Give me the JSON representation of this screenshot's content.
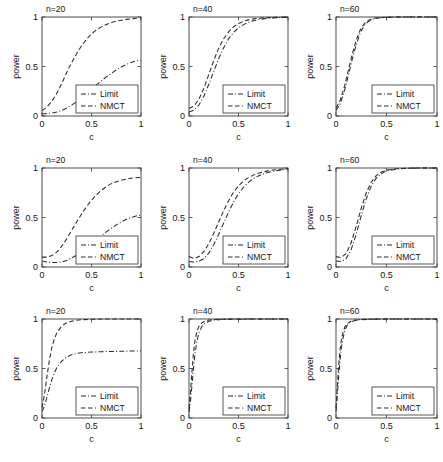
{
  "figure": {
    "layout": "3x3 grid of power curve panels",
    "background_color": "#ffffff",
    "line_color": "#2b2b2b",
    "axis_color": "#3a3a3a"
  },
  "axis": {
    "xlabel": "c",
    "ylabel": "power",
    "xticks": [
      "0",
      "0.5",
      "1"
    ],
    "yticks": [
      "0",
      "0.5",
      "1"
    ],
    "xlim": [
      0,
      1
    ],
    "ylim": [
      0,
      1
    ]
  },
  "legend": {
    "position": "lower-right",
    "entries": [
      {
        "label": "Limit",
        "style": "dash-dot"
      },
      {
        "label": "NMCT",
        "style": "dashed"
      }
    ]
  },
  "chart_data": [
    {
      "type": "line",
      "panel_id": "r1c1",
      "title": "n=20",
      "xlabel": "c",
      "ylabel": "power",
      "xlim": [
        0,
        1
      ],
      "ylim": [
        0,
        1
      ],
      "xticks": [
        0,
        0.5,
        1
      ],
      "yticks": [
        0,
        0.5,
        1
      ],
      "grid": false,
      "legend": [
        "Limit",
        "NMCT"
      ],
      "x": [
        0,
        0.05,
        0.1,
        0.15,
        0.2,
        0.25,
        0.3,
        0.35,
        0.4,
        0.45,
        0.5,
        0.55,
        0.6,
        0.65,
        0.7,
        0.75,
        0.8,
        0.85,
        0.9,
        0.95,
        1.0
      ],
      "series": [
        {
          "name": "Limit",
          "style": "dash-dot",
          "values": [
            0.02,
            0.025,
            0.03,
            0.04,
            0.055,
            0.08,
            0.11,
            0.145,
            0.185,
            0.225,
            0.27,
            0.315,
            0.355,
            0.395,
            0.43,
            0.465,
            0.495,
            0.52,
            0.54,
            0.555,
            0.565
          ]
        },
        {
          "name": "NMCT",
          "style": "dashed",
          "values": [
            0.055,
            0.09,
            0.15,
            0.23,
            0.33,
            0.44,
            0.54,
            0.63,
            0.71,
            0.775,
            0.83,
            0.87,
            0.9,
            0.925,
            0.945,
            0.958,
            0.968,
            0.976,
            0.982,
            0.987,
            0.99
          ]
        }
      ]
    },
    {
      "type": "line",
      "panel_id": "r1c2",
      "title": "n=40",
      "xlabel": "c",
      "ylabel": "power",
      "xlim": [
        0,
        1
      ],
      "ylim": [
        0,
        1
      ],
      "xticks": [
        0,
        0.5,
        1
      ],
      "yticks": [
        0,
        0.5,
        1
      ],
      "grid": false,
      "legend": [
        "Limit",
        "NMCT"
      ],
      "x": [
        0,
        0.05,
        0.1,
        0.15,
        0.2,
        0.25,
        0.3,
        0.35,
        0.4,
        0.45,
        0.5,
        0.55,
        0.6,
        0.65,
        0.7,
        0.75,
        0.8,
        0.85,
        0.9,
        0.95,
        1.0
      ],
      "series": [
        {
          "name": "Limit",
          "style": "dash-dot",
          "values": [
            0.04,
            0.06,
            0.11,
            0.2,
            0.32,
            0.45,
            0.58,
            0.69,
            0.78,
            0.845,
            0.89,
            0.923,
            0.945,
            0.961,
            0.973,
            0.981,
            0.987,
            0.991,
            0.994,
            0.996,
            0.998
          ]
        },
        {
          "name": "NMCT",
          "style": "dashed",
          "values": [
            0.075,
            0.1,
            0.17,
            0.28,
            0.42,
            0.56,
            0.685,
            0.78,
            0.85,
            0.9,
            0.935,
            0.957,
            0.971,
            0.981,
            0.987,
            0.991,
            0.994,
            0.996,
            0.997,
            0.999,
            1.0
          ]
        }
      ]
    },
    {
      "type": "line",
      "panel_id": "r1c3",
      "title": "n=60",
      "xlabel": "c",
      "ylabel": "power",
      "xlim": [
        0,
        1
      ],
      "ylim": [
        0,
        1
      ],
      "xticks": [
        0,
        0.5,
        1
      ],
      "yticks": [
        0,
        0.5,
        1
      ],
      "grid": false,
      "legend": [
        "Limit",
        "NMCT"
      ],
      "x": [
        0,
        0.04,
        0.08,
        0.12,
        0.16,
        0.2,
        0.24,
        0.28,
        0.32,
        0.36,
        0.4,
        0.5,
        0.6,
        0.7,
        0.8,
        0.9,
        1.0
      ],
      "series": [
        {
          "name": "Limit",
          "style": "dash-dot",
          "values": [
            0.055,
            0.12,
            0.24,
            0.4,
            0.57,
            0.72,
            0.84,
            0.915,
            0.955,
            0.977,
            0.988,
            0.997,
            0.999,
            1.0,
            1.0,
            1.0,
            1.0
          ]
        },
        {
          "name": "NMCT",
          "style": "dashed",
          "values": [
            0.08,
            0.155,
            0.285,
            0.45,
            0.62,
            0.765,
            0.87,
            0.932,
            0.966,
            0.983,
            0.992,
            0.998,
            1.0,
            1.0,
            1.0,
            1.0,
            1.0
          ]
        }
      ]
    },
    {
      "type": "line",
      "panel_id": "r2c1",
      "title": "n=20",
      "xlabel": "c",
      "ylabel": "power",
      "xlim": [
        0,
        1
      ],
      "ylim": [
        0,
        1
      ],
      "xticks": [
        0,
        0.5,
        1
      ],
      "yticks": [
        0,
        0.5,
        1
      ],
      "grid": false,
      "legend": [
        "Limit",
        "NMCT"
      ],
      "x": [
        0,
        0.05,
        0.1,
        0.15,
        0.2,
        0.25,
        0.3,
        0.35,
        0.4,
        0.45,
        0.5,
        0.55,
        0.6,
        0.65,
        0.7,
        0.75,
        0.8,
        0.85,
        0.9,
        0.95,
        1.0
      ],
      "series": [
        {
          "name": "Limit",
          "style": "dash-dot",
          "values": [
            0.06,
            0.05,
            0.045,
            0.045,
            0.05,
            0.065,
            0.09,
            0.12,
            0.155,
            0.195,
            0.235,
            0.275,
            0.315,
            0.355,
            0.39,
            0.425,
            0.455,
            0.48,
            0.5,
            0.515,
            0.525
          ]
        },
        {
          "name": "NMCT",
          "style": "dashed",
          "values": [
            0.1,
            0.1,
            0.115,
            0.15,
            0.21,
            0.285,
            0.37,
            0.455,
            0.535,
            0.61,
            0.675,
            0.73,
            0.775,
            0.812,
            0.842,
            0.862,
            0.877,
            0.888,
            0.896,
            0.902,
            0.905
          ]
        }
      ]
    },
    {
      "type": "line",
      "panel_id": "r2c2",
      "title": "n=40",
      "xlabel": "c",
      "ylabel": "power",
      "xlim": [
        0,
        1
      ],
      "ylim": [
        0,
        1
      ],
      "xticks": [
        0,
        0.5,
        1
      ],
      "yticks": [
        0,
        0.5,
        1
      ],
      "grid": false,
      "legend": [
        "Limit",
        "NMCT"
      ],
      "x": [
        0,
        0.05,
        0.1,
        0.15,
        0.2,
        0.25,
        0.3,
        0.35,
        0.4,
        0.45,
        0.5,
        0.55,
        0.6,
        0.65,
        0.7,
        0.75,
        0.8,
        0.85,
        0.9,
        0.95,
        1.0
      ],
      "series": [
        {
          "name": "Limit",
          "style": "dash-dot",
          "values": [
            0.055,
            0.05,
            0.058,
            0.085,
            0.14,
            0.225,
            0.33,
            0.445,
            0.555,
            0.655,
            0.74,
            0.805,
            0.855,
            0.893,
            0.92,
            0.94,
            0.955,
            0.967,
            0.976,
            0.983,
            0.988
          ]
        },
        {
          "name": "NMCT",
          "style": "dashed",
          "values": [
            0.105,
            0.085,
            0.105,
            0.155,
            0.235,
            0.34,
            0.455,
            0.57,
            0.67,
            0.755,
            0.82,
            0.868,
            0.903,
            0.928,
            0.947,
            0.961,
            0.971,
            0.979,
            0.985,
            0.99,
            0.995
          ]
        }
      ]
    },
    {
      "type": "line",
      "panel_id": "r2c3",
      "title": "n=60",
      "xlabel": "c",
      "ylabel": "power",
      "xlim": [
        0,
        1
      ],
      "ylim": [
        0,
        1
      ],
      "xticks": [
        0,
        0.5,
        1
      ],
      "yticks": [
        0,
        0.5,
        1
      ],
      "grid": false,
      "legend": [
        "Limit",
        "NMCT"
      ],
      "x": [
        0,
        0.05,
        0.1,
        0.15,
        0.2,
        0.25,
        0.3,
        0.35,
        0.4,
        0.45,
        0.5,
        0.6,
        0.7,
        0.8,
        0.9,
        1.0
      ],
      "series": [
        {
          "name": "Limit",
          "style": "dash-dot",
          "values": [
            0.06,
            0.055,
            0.085,
            0.175,
            0.33,
            0.52,
            0.69,
            0.82,
            0.9,
            0.945,
            0.97,
            0.99,
            0.997,
            0.999,
            1.0,
            1.0
          ]
        },
        {
          "name": "NMCT",
          "style": "dashed",
          "values": [
            0.105,
            0.095,
            0.135,
            0.245,
            0.41,
            0.595,
            0.75,
            0.86,
            0.925,
            0.96,
            0.978,
            0.993,
            0.998,
            1.0,
            1.0,
            1.0
          ]
        }
      ]
    },
    {
      "type": "line",
      "panel_id": "r3c1",
      "title": "n=20",
      "xlabel": "c",
      "ylabel": "power",
      "xlim": [
        0,
        1
      ],
      "ylim": [
        0,
        1
      ],
      "xticks": [
        0,
        0.5,
        1
      ],
      "yticks": [
        0,
        0.5,
        1
      ],
      "grid": false,
      "legend": [
        "Limit",
        "NMCT"
      ],
      "x": [
        0,
        0.025,
        0.05,
        0.075,
        0.1,
        0.125,
        0.15,
        0.2,
        0.25,
        0.3,
        0.35,
        0.4,
        0.5,
        0.6,
        0.7,
        0.8,
        0.9,
        1.0
      ],
      "series": [
        {
          "name": "Limit",
          "style": "dash-dot",
          "values": [
            0.065,
            0.12,
            0.21,
            0.305,
            0.39,
            0.455,
            0.51,
            0.575,
            0.615,
            0.64,
            0.652,
            0.66,
            0.666,
            0.67,
            0.672,
            0.674,
            0.676,
            0.678
          ]
        },
        {
          "name": "NMCT",
          "style": "dashed",
          "values": [
            0.105,
            0.24,
            0.42,
            0.585,
            0.715,
            0.8,
            0.862,
            0.93,
            0.962,
            0.978,
            0.988,
            0.993,
            0.997,
            0.999,
            1.0,
            1.0,
            1.0,
            1.0
          ]
        }
      ]
    },
    {
      "type": "line",
      "panel_id": "r3c2",
      "title": "n=40",
      "xlabel": "c",
      "ylabel": "power",
      "xlim": [
        0,
        1
      ],
      "ylim": [
        0,
        1
      ],
      "xticks": [
        0,
        0.5,
        1
      ],
      "yticks": [
        0,
        0.5,
        1
      ],
      "grid": false,
      "legend": [
        "Limit",
        "NMCT"
      ],
      "x": [
        0,
        0.015,
        0.03,
        0.045,
        0.06,
        0.08,
        0.1,
        0.13,
        0.16,
        0.2,
        0.25,
        0.3,
        0.4,
        0.5,
        0.6,
        0.7,
        0.8,
        0.9,
        1.0
      ],
      "series": [
        {
          "name": "Limit",
          "style": "dash-dot",
          "values": [
            0.06,
            0.17,
            0.33,
            0.5,
            0.645,
            0.775,
            0.86,
            0.925,
            0.957,
            0.977,
            0.988,
            0.993,
            0.997,
            0.998,
            0.999,
            1.0,
            1.0,
            1.0,
            1.0
          ]
        },
        {
          "name": "NMCT",
          "style": "dashed",
          "values": [
            0.095,
            0.26,
            0.47,
            0.655,
            0.78,
            0.875,
            0.925,
            0.962,
            0.978,
            0.989,
            0.995,
            0.997,
            0.999,
            1.0,
            1.0,
            1.0,
            1.0,
            1.0,
            1.0
          ]
        }
      ]
    },
    {
      "type": "line",
      "panel_id": "r3c3",
      "title": "n=60",
      "xlabel": "c",
      "ylabel": "power",
      "xlim": [
        0,
        1
      ],
      "ylim": [
        0,
        1
      ],
      "xticks": [
        0,
        0.5,
        1
      ],
      "yticks": [
        0,
        0.5,
        1
      ],
      "grid": false,
      "legend": [
        "Limit",
        "NMCT"
      ],
      "x": [
        0,
        0.012,
        0.025,
        0.04,
        0.055,
        0.07,
        0.09,
        0.11,
        0.14,
        0.18,
        0.22,
        0.3,
        0.4,
        0.5,
        0.6,
        0.7,
        0.8,
        0.9,
        1.0
      ],
      "series": [
        {
          "name": "Limit",
          "style": "dash-dot",
          "values": [
            0.065,
            0.21,
            0.4,
            0.585,
            0.72,
            0.81,
            0.89,
            0.935,
            0.965,
            0.983,
            0.991,
            0.996,
            0.998,
            0.999,
            1.0,
            1.0,
            1.0,
            1.0,
            1.0
          ]
        },
        {
          "name": "NMCT",
          "style": "dashed",
          "values": [
            0.1,
            0.3,
            0.515,
            0.69,
            0.8,
            0.87,
            0.925,
            0.952,
            0.974,
            0.987,
            0.993,
            0.997,
            0.999,
            1.0,
            1.0,
            1.0,
            1.0,
            1.0,
            1.0
          ]
        }
      ]
    }
  ]
}
